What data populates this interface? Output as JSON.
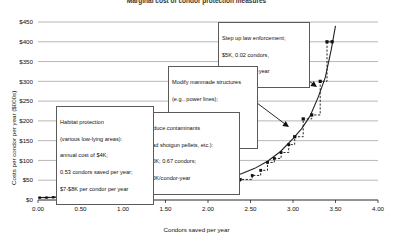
{
  "chart_data": {
    "type": "line",
    "title": "Marginal cost of condor protection measures",
    "xlabel": "Condors saved per year",
    "ylabel": "Costs per condor per year ($000s)",
    "xlim": [
      0.0,
      4.0
    ],
    "ylim": [
      0,
      450
    ],
    "xticks": [
      "0.00",
      "0.50",
      "1.00",
      "1.50",
      "2.00",
      "2.50",
      "3.00",
      "3.50",
      "4.00"
    ],
    "yticks": [
      "$0",
      "$50",
      "$100",
      "$150",
      "$200",
      "$250",
      "$300",
      "$350",
      "$400",
      "$450"
    ],
    "grid": true,
    "legend": "none",
    "series": [
      {
        "name": "Smooth marginal cost curve",
        "style": "solid",
        "x": [
          0.0,
          0.2,
          0.4,
          0.6,
          0.8,
          1.0,
          1.2,
          1.4,
          1.6,
          1.8,
          2.0,
          2.2,
          2.4,
          2.55,
          2.7,
          2.85,
          3.0,
          3.1,
          3.2,
          3.3,
          3.38,
          3.45,
          3.5
        ],
        "y": [
          6,
          7,
          8,
          10,
          12,
          14,
          17,
          21,
          26,
          32,
          40,
          51,
          67,
          80,
          98,
          122,
          155,
          180,
          212,
          262,
          310,
          380,
          440
        ]
      },
      {
        "name": "Step function (marginal measures)",
        "style": "dashed-step",
        "x": [
          0.02,
          0.1,
          0.18,
          0.26,
          0.33,
          0.4,
          0.5,
          0.62,
          0.74,
          0.86,
          1.0,
          1.15,
          1.32,
          1.5,
          1.7,
          1.88,
          2.05,
          2.22,
          2.38,
          2.52,
          2.62,
          2.7,
          2.78,
          2.86,
          2.95,
          3.02,
          3.12,
          3.22,
          3.32,
          3.4
        ],
        "y": [
          6,
          6,
          7,
          7,
          8,
          9,
          10,
          11,
          12,
          13,
          15,
          17,
          19,
          22,
          26,
          30,
          36,
          44,
          52,
          62,
          75,
          95,
          105,
          120,
          140,
          160,
          205,
          215,
          300,
          400
        ]
      }
    ],
    "markers": [
      {
        "x": 0.02,
        "y": 6
      },
      {
        "x": 0.1,
        "y": 6
      },
      {
        "x": 0.18,
        "y": 7
      },
      {
        "x": 0.26,
        "y": 7
      },
      {
        "x": 0.33,
        "y": 8
      },
      {
        "x": 0.4,
        "y": 9
      },
      {
        "x": 0.5,
        "y": 10
      },
      {
        "x": 0.62,
        "y": 11
      },
      {
        "x": 0.74,
        "y": 12
      },
      {
        "x": 0.86,
        "y": 13
      },
      {
        "x": 1.0,
        "y": 15
      },
      {
        "x": 1.15,
        "y": 17
      },
      {
        "x": 1.32,
        "y": 19
      },
      {
        "x": 1.5,
        "y": 22
      },
      {
        "x": 1.7,
        "y": 26
      },
      {
        "x": 1.88,
        "y": 30
      },
      {
        "x": 2.05,
        "y": 36
      },
      {
        "x": 2.22,
        "y": 44
      },
      {
        "x": 2.38,
        "y": 52
      },
      {
        "x": 2.52,
        "y": 62
      },
      {
        "x": 2.62,
        "y": 75
      },
      {
        "x": 2.7,
        "y": 95
      },
      {
        "x": 2.78,
        "y": 105
      },
      {
        "x": 2.86,
        "y": 120
      },
      {
        "x": 2.95,
        "y": 140
      },
      {
        "x": 3.02,
        "y": 160
      },
      {
        "x": 3.12,
        "y": 205
      },
      {
        "x": 3.22,
        "y": 215
      },
      {
        "x": 3.32,
        "y": 300
      },
      {
        "x": 3.4,
        "y": 400
      },
      {
        "x": 3.46,
        "y": 400
      }
    ]
  },
  "callouts": {
    "law_enforcement": {
      "line1": "Step up law enforcement;",
      "line2": "$5K, 0.02 condors,",
      "line3": "$270K/condor-year"
    },
    "manmade_structures": {
      "line1": "Modify manmade structures",
      "line2": "(e.g., power lines);",
      "line3": "$105K, 0.50 condors/yr.",
      "line4": "$210K/condor-year"
    },
    "contaminants": {
      "line1": "Reduce contaminants",
      "line2": "(lead shotgun pellets, etc.):",
      "line3": "$20K; 0.67 condors;",
      "line4": "$30K/condor-year"
    },
    "habitat": {
      "line1": "Habitat protection",
      "line2": "(various low-lying areas):",
      "line3": "annual cost of $4K;",
      "line4": "0.53 condors saved per year;",
      "line5": "$7-$8K per condor per year"
    }
  },
  "colors": {
    "grid": "#9a9a9a",
    "curve": "#222222",
    "marker": "#111111",
    "callout_border": "#5a5a5a",
    "text": "#111111"
  }
}
